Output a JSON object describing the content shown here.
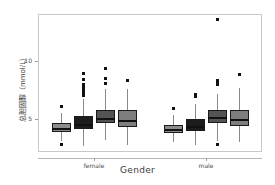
{
  "chart_data": {
    "type": "box",
    "title": "",
    "xlabel": "Gender",
    "ylabel": "总胆固醇（mmol/L）",
    "categories": [
      "female",
      "male"
    ],
    "ylim": [
      2.2,
      14.0
    ],
    "yticks": [
      5,
      10
    ],
    "ytick_labels": [
      "5",
      "10"
    ],
    "grid": false,
    "legend": "none",
    "series": [
      {
        "name": "group-1",
        "color": "#8c8c8c",
        "boxes": [
          {
            "category": "female",
            "q1": 3.95,
            "median": 4.25,
            "q3": 4.65,
            "whisker_low": 3.15,
            "whisker_high": 5.55,
            "outliers": [
              6.05,
              2.85
            ]
          },
          {
            "category": "male",
            "q1": 3.85,
            "median": 4.15,
            "q3": 4.55,
            "whisker_low": 3.05,
            "whisker_high": 5.35,
            "outliers": [
              5.95
            ]
          }
        ]
      },
      {
        "name": "group-2",
        "color": "#1c1c1c",
        "boxes": [
          {
            "category": "female",
            "q1": 4.15,
            "median": 4.6,
            "q3": 5.25,
            "whisker_low": 2.75,
            "whisker_high": 6.7,
            "outliers": [
              8.9,
              8.4,
              8.0,
              7.75,
              7.5,
              7.2,
              7.0
            ]
          },
          {
            "category": "male",
            "q1": 4.0,
            "median": 4.4,
            "q3": 5.0,
            "whisker_low": 2.8,
            "whisker_high": 6.3,
            "outliers": [
              7.1,
              6.95
            ]
          }
        ]
      },
      {
        "name": "group-3",
        "color": "#545454",
        "boxes": [
          {
            "category": "female",
            "q1": 4.65,
            "median": 5.15,
            "q3": 5.8,
            "whisker_low": 3.2,
            "whisker_high": 7.6,
            "outliers": [
              9.3,
              8.5,
              8.1
            ]
          },
          {
            "category": "male",
            "q1": 4.7,
            "median": 5.2,
            "q3": 5.8,
            "whisker_low": 3.1,
            "whisker_high": 7.2,
            "outliers": [
              13.5,
              8.35,
              8.15,
              7.95,
              2.85
            ]
          }
        ]
      },
      {
        "name": "group-4",
        "color": "#7e7e7e",
        "boxes": [
          {
            "category": "female",
            "q1": 4.35,
            "median": 4.95,
            "q3": 5.75,
            "whisker_low": 2.8,
            "whisker_high": 7.6,
            "outliers": [
              8.35
            ]
          },
          {
            "category": "male",
            "q1": 4.4,
            "median": 5.05,
            "q3": 5.75,
            "whisker_low": 3.05,
            "whisker_high": 7.65,
            "outliers": [
              8.85
            ]
          }
        ]
      }
    ]
  },
  "axes": {
    "x_title": "Gender",
    "y_title": "总胆固醇（mmol/L）",
    "x_labels": [
      "female",
      "male"
    ],
    "y_labels": [
      "5",
      "10"
    ]
  }
}
